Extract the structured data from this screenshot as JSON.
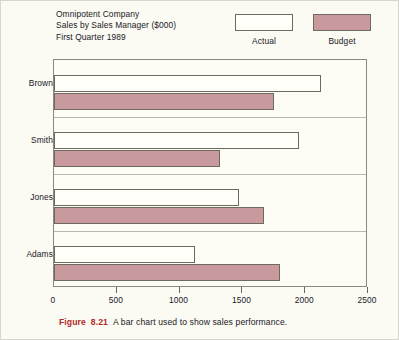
{
  "chart_data": {
    "type": "bar",
    "orientation": "horizontal",
    "title": "Omnipotent Company",
    "subtitle": "Sales by Sales Manager ($000)",
    "subtitle2": "First Quarter 1989",
    "title_lines": [
      "Omnipotent Company",
      "Sales by Sales Manager ($000)",
      "First Quarter 1989"
    ],
    "categories": [
      "Brown",
      "Smith",
      "Jones",
      "Adams"
    ],
    "series": [
      {
        "name": "Actual",
        "values": [
          2125,
          1950,
          1475,
          1125
        ],
        "color": "#fffef8"
      },
      {
        "name": "Budget",
        "values": [
          1750,
          1325,
          1675,
          1800
        ],
        "color": "#c99a9d"
      }
    ],
    "xlabel": "",
    "ylabel": "",
    "xlim": [
      0,
      2500
    ],
    "xticks": [
      0,
      500,
      1000,
      1500,
      2000,
      2500
    ],
    "xtick_labels": [
      "0",
      "500",
      "1000",
      "1500",
      "2000",
      "2500"
    ],
    "grid": true,
    "grid_axis": "y",
    "legend_position": "top-right"
  },
  "legend": {
    "actual_label": "Actual",
    "budget_label": "Budget"
  },
  "caption": {
    "figure_label": "Figure",
    "figure_number": "8.21",
    "text": "A bar chart used to show sales performance."
  }
}
